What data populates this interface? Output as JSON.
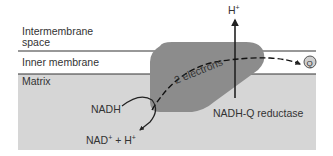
{
  "diagram": {
    "regions": {
      "intermembrane_line1": "Intermembrane",
      "intermembrane_line2": "space",
      "inner_membrane": "Inner membrane",
      "matrix": "Matrix"
    },
    "labels": {
      "proton_top": "H",
      "proton_top_sup": "+",
      "electrons": "2 electrons",
      "quinone": "Q",
      "nadh": "NADH",
      "nad_product": "NAD",
      "nad_product_sup": "+",
      "plus": " + H",
      "plus_sup": "+",
      "enzyme": "NADH-Q reductase"
    },
    "colors": {
      "matrix_fill": "#d6d6d6",
      "protein_fill": "#8c8c8c",
      "membrane_line": "#333333",
      "arrow": "#222222",
      "quinone_fill": "#cfcfcf",
      "background": "#ffffff"
    }
  }
}
